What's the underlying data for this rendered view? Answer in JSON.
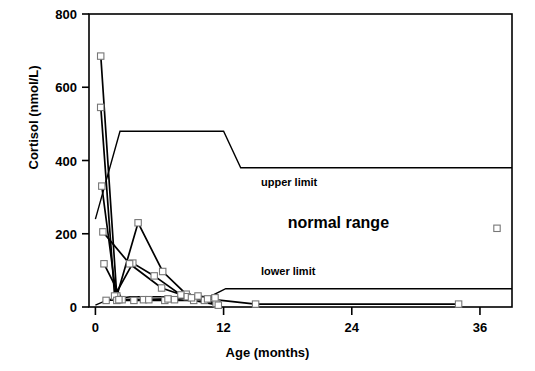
{
  "chart_data": {
    "type": "line",
    "title": "",
    "xlabel": "Age (months)",
    "ylabel": "Cortisol (nmol/L)",
    "xlim": [
      -0.6,
      39.0
    ],
    "ylim": [
      0,
      800
    ],
    "xticks": [
      0,
      12,
      24,
      36
    ],
    "xticklabels": [
      "0",
      "12",
      "24",
      "36"
    ],
    "yticks": [
      0,
      200,
      400,
      600,
      800
    ],
    "yticklabels": [
      "0",
      "200",
      "400",
      "600",
      "800"
    ],
    "grid": false,
    "legend": null,
    "marker": "open-square",
    "annotations": [
      {
        "text": "upper limit",
        "x": 15.5,
        "y": 330,
        "style": "small-bold"
      },
      {
        "text": "normal range",
        "x": 18.0,
        "y": 215,
        "style": "large-bold"
      },
      {
        "text": "lower limit",
        "x": 15.5,
        "y": 88,
        "style": "small-bold"
      }
    ],
    "reference_bands": [
      {
        "name": "upper limit",
        "x": [
          0,
          2.3,
          12.0,
          13.6,
          39.0
        ],
        "y": [
          240,
          480,
          480,
          380,
          380
        ]
      },
      {
        "name": "lower limit",
        "x": [
          0,
          1.2,
          3.3,
          10.7,
          12.2,
          39.0
        ],
        "y": [
          5,
          20,
          28,
          28,
          50,
          50
        ]
      }
    ],
    "series": [
      {
        "name": "patient-1",
        "x": [
          0.5,
          2.0,
          4.0,
          6.3,
          8.5,
          11.4
        ],
        "y": [
          685,
          30,
          230,
          97,
          35,
          8
        ]
      },
      {
        "name": "patient-2",
        "x": [
          0.5,
          1.8,
          3.5,
          5.5,
          8.0,
          11.3
        ],
        "y": [
          545,
          30,
          120,
          85,
          33,
          10
        ]
      },
      {
        "name": "patient-3",
        "x": [
          0.6,
          2.0,
          3.6,
          6.5,
          9.2,
          11.5
        ],
        "y": [
          330,
          18,
          18,
          18,
          18,
          5
        ]
      },
      {
        "name": "patient-4",
        "x": [
          0.7,
          3.2,
          6.2,
          8.6,
          10.2
        ],
        "y": [
          205,
          118,
          52,
          28,
          18
        ]
      },
      {
        "name": "patient-5",
        "x": [
          0.8,
          2.5,
          4.5,
          6.8,
          9.0,
          10.5,
          15.0,
          34.0
        ],
        "y": [
          118,
          20,
          20,
          22,
          25,
          22,
          8,
          8
        ]
      },
      {
        "name": "patient-6",
        "x": [
          1.0,
          2.2,
          5.0,
          7.4,
          9.6,
          11.2
        ],
        "y": [
          18,
          20,
          20,
          20,
          30,
          25
        ]
      }
    ],
    "isolated_points": [
      {
        "x": 37.6,
        "y": 215
      }
    ]
  }
}
